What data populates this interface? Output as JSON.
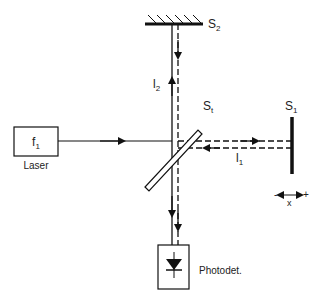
{
  "diagram": {
    "laser": {
      "label": "Laser",
      "source_label": "f",
      "source_sub": "1"
    },
    "beam_splitter": {
      "label": "S",
      "sub": "t"
    },
    "mirror_s1": {
      "label": "S",
      "sub": "1"
    },
    "mirror_s2": {
      "label": "S",
      "sub": "2"
    },
    "beam_1": {
      "label": "l",
      "sub": "1"
    },
    "beam_2": {
      "label": "l",
      "sub": "2"
    },
    "detector": {
      "label": "Photodet."
    },
    "displacement": {
      "minus": "-",
      "plus": "+",
      "axis": "x"
    },
    "colors": {
      "line": "#111111",
      "background": "#ffffff"
    }
  }
}
